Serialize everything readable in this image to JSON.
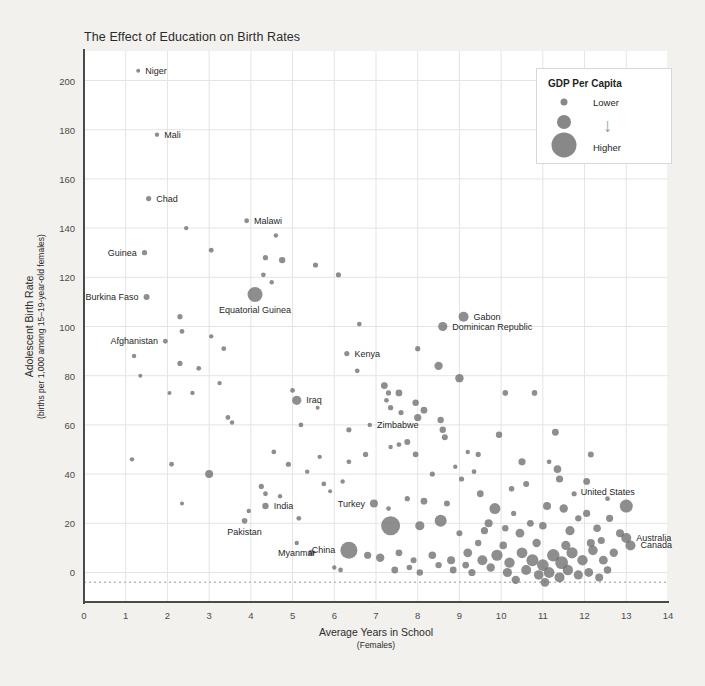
{
  "chart_data": {
    "type": "scatter",
    "title": "The Effect of Education on Birth Rates",
    "xlabel": "Average Years in School",
    "xlabel_sub": "(Females)",
    "ylabel": "Adolescent Birth Rate",
    "ylabel_sub": "(births per 1,000 among 15–19-year-old females)",
    "xlim": [
      0,
      14
    ],
    "ylim": [
      -12,
      212
    ],
    "xticks": [
      0,
      1,
      2,
      3,
      4,
      5,
      6,
      7,
      8,
      9,
      10,
      11,
      12,
      13,
      14
    ],
    "yticks": [
      0,
      20,
      40,
      60,
      80,
      100,
      120,
      140,
      160,
      180,
      200
    ],
    "grid": true,
    "reference_line_y": -4,
    "point_color": "#6e6e6e",
    "size_encodes": "GDP Per Capita",
    "legend": {
      "title": "GDP Per Capita",
      "low_label": "Lower",
      "high_label": "Higher",
      "arrow": "↓",
      "position": "top-right"
    },
    "labeled_points": [
      {
        "name": "Niger",
        "x": 1.3,
        "y": 204,
        "r": 2.0,
        "anchor": "right"
      },
      {
        "name": "Mali",
        "x": 1.75,
        "y": 178,
        "r": 2.2,
        "anchor": "right"
      },
      {
        "name": "Chad",
        "x": 1.55,
        "y": 152,
        "r": 2.6,
        "anchor": "right"
      },
      {
        "name": "Malawi",
        "x": 3.9,
        "y": 143,
        "r": 2.4,
        "anchor": "right"
      },
      {
        "name": "Guinea",
        "x": 1.45,
        "y": 130,
        "r": 2.6,
        "anchor": "left"
      },
      {
        "name": "Burkina Faso",
        "x": 1.5,
        "y": 112,
        "r": 3.0,
        "anchor": "left"
      },
      {
        "name": "Equatorial Guinea",
        "x": 4.1,
        "y": 113,
        "r": 7.5,
        "anchor": "below"
      },
      {
        "name": "Afghanistan",
        "x": 1.95,
        "y": 94,
        "r": 2.4,
        "anchor": "left"
      },
      {
        "name": "Gabon",
        "x": 9.1,
        "y": 104,
        "r": 5.0,
        "anchor": "right"
      },
      {
        "name": "Dominican Republic",
        "x": 8.6,
        "y": 100,
        "r": 4.6,
        "anchor": "right"
      },
      {
        "name": "Kenya",
        "x": 6.3,
        "y": 89,
        "r": 2.6,
        "anchor": "right"
      },
      {
        "name": "Iraq",
        "x": 5.1,
        "y": 70,
        "r": 4.6,
        "anchor": "right"
      },
      {
        "name": "Zimbabwe",
        "x": 6.85,
        "y": 60,
        "r": 2.2,
        "anchor": "right"
      },
      {
        "name": "Turkey",
        "x": 6.95,
        "y": 28,
        "r": 4.0,
        "anchor": "left"
      },
      {
        "name": "India",
        "x": 4.35,
        "y": 27,
        "r": 3.2,
        "anchor": "right"
      },
      {
        "name": "Pakistan",
        "x": 3.85,
        "y": 21,
        "r": 2.8,
        "anchor": "below"
      },
      {
        "name": "Myanmar",
        "x": 5.1,
        "y": 12,
        "r": 2.2,
        "anchor": "below"
      },
      {
        "name": "China",
        "x": 6.35,
        "y": 9,
        "r": 8.5,
        "anchor": "left"
      },
      {
        "name": "United States",
        "x": 13.0,
        "y": 27,
        "r": 6.5,
        "anchor": "above-left"
      },
      {
        "name": "Australia",
        "x": 13.0,
        "y": 14,
        "r": 5.0,
        "anchor": "right"
      },
      {
        "name": "Canada",
        "x": 13.1,
        "y": 11,
        "r": 5.0,
        "anchor": "right"
      }
    ],
    "points": [
      [
        1.3,
        204,
        2.0
      ],
      [
        1.75,
        178,
        2.2
      ],
      [
        1.55,
        152,
        2.6
      ],
      [
        3.9,
        143,
        2.4
      ],
      [
        2.45,
        140,
        2.2
      ],
      [
        1.45,
        130,
        2.6
      ],
      [
        3.05,
        131,
        2.4
      ],
      [
        4.6,
        137,
        2.2
      ],
      [
        4.35,
        128,
        2.6
      ],
      [
        4.75,
        127,
        3.2
      ],
      [
        4.3,
        121,
        2.4
      ],
      [
        5.55,
        125,
        2.6
      ],
      [
        6.1,
        121,
        2.6
      ],
      [
        4.5,
        118,
        2.2
      ],
      [
        1.5,
        112,
        3.0
      ],
      [
        4.1,
        113,
        7.5
      ],
      [
        2.3,
        104,
        2.6
      ],
      [
        2.35,
        98,
        2.4
      ],
      [
        1.95,
        94,
        2.4
      ],
      [
        3.05,
        96,
        2.2
      ],
      [
        9.1,
        104,
        5.0
      ],
      [
        8.6,
        100,
        4.6
      ],
      [
        6.6,
        101,
        2.4
      ],
      [
        6.3,
        89,
        2.6
      ],
      [
        3.35,
        91,
        2.4
      ],
      [
        1.2,
        88,
        2.2
      ],
      [
        1.35,
        80,
        2.0
      ],
      [
        2.3,
        85,
        2.6
      ],
      [
        2.75,
        83,
        2.4
      ],
      [
        3.25,
        77,
        2.2
      ],
      [
        2.05,
        73,
        2.0
      ],
      [
        2.6,
        73,
        2.2
      ],
      [
        8.0,
        91,
        2.6
      ],
      [
        8.5,
        84,
        4.2
      ],
      [
        9.0,
        79,
        4.2
      ],
      [
        6.55,
        82,
        2.4
      ],
      [
        7.2,
        76,
        3.4
      ],
      [
        7.3,
        73,
        2.6
      ],
      [
        7.55,
        73,
        3.4
      ],
      [
        7.25,
        70,
        2.4
      ],
      [
        7.35,
        67,
        2.6
      ],
      [
        5.1,
        70,
        4.6
      ],
      [
        5.0,
        74,
        2.4
      ],
      [
        5.6,
        67,
        2.0
      ],
      [
        3.45,
        63,
        2.4
      ],
      [
        3.55,
        61,
        2.2
      ],
      [
        10.1,
        73,
        2.8
      ],
      [
        10.8,
        73,
        2.8
      ],
      [
        7.95,
        69,
        3.2
      ],
      [
        8.15,
        66,
        3.4
      ],
      [
        6.85,
        60,
        2.2
      ],
      [
        7.6,
        65,
        2.6
      ],
      [
        8.0,
        63,
        3.6
      ],
      [
        8.55,
        62,
        3.2
      ],
      [
        8.6,
        58,
        3.2
      ],
      [
        8.65,
        55,
        3.0
      ],
      [
        6.35,
        58,
        2.6
      ],
      [
        5.2,
        60,
        2.4
      ],
      [
        9.95,
        56,
        3.2
      ],
      [
        11.3,
        57,
        3.4
      ],
      [
        7.75,
        53,
        3.0
      ],
      [
        7.55,
        52,
        2.4
      ],
      [
        7.35,
        51,
        2.2
      ],
      [
        7.95,
        48,
        2.8
      ],
      [
        6.75,
        48,
        2.6
      ],
      [
        6.35,
        45,
        2.4
      ],
      [
        9.2,
        49,
        2.2
      ],
      [
        9.45,
        48,
        2.6
      ],
      [
        12.15,
        48,
        3.0
      ],
      [
        1.15,
        46,
        2.2
      ],
      [
        2.1,
        44,
        2.4
      ],
      [
        3.0,
        40,
        4.0
      ],
      [
        4.9,
        44,
        2.6
      ],
      [
        5.35,
        41,
        2.2
      ],
      [
        10.5,
        45,
        3.6
      ],
      [
        11.15,
        45,
        2.4
      ],
      [
        11.35,
        42,
        3.8
      ],
      [
        11.4,
        38,
        3.6
      ],
      [
        10.6,
        36,
        3.0
      ],
      [
        12.05,
        37,
        3.4
      ],
      [
        4.25,
        35,
        2.6
      ],
      [
        4.35,
        32,
        2.4
      ],
      [
        4.7,
        31,
        2.2
      ],
      [
        6.95,
        28,
        4.0
      ],
      [
        7.3,
        26,
        2.4
      ],
      [
        7.75,
        30,
        2.6
      ],
      [
        8.15,
        29,
        3.4
      ],
      [
        8.7,
        28,
        3.0
      ],
      [
        9.5,
        32,
        3.4
      ],
      [
        9.85,
        26,
        5.5
      ],
      [
        10.3,
        24,
        2.6
      ],
      [
        11.1,
        27,
        4.0
      ],
      [
        11.5,
        26,
        4.2
      ],
      [
        12.05,
        24,
        3.6
      ],
      [
        12.6,
        22,
        3.6
      ],
      [
        13.0,
        27,
        6.5
      ],
      [
        2.35,
        28,
        2.0
      ],
      [
        4.35,
        27,
        3.2
      ],
      [
        3.85,
        21,
        2.8
      ],
      [
        3.95,
        25,
        2.2
      ],
      [
        5.15,
        22,
        2.4
      ],
      [
        8.55,
        21,
        6.0
      ],
      [
        8.05,
        19,
        4.6
      ],
      [
        7.35,
        19,
        9.5
      ],
      [
        9.0,
        16,
        3.0
      ],
      [
        9.6,
        17,
        3.6
      ],
      [
        10.1,
        18,
        3.2
      ],
      [
        10.45,
        16,
        4.4
      ],
      [
        11.0,
        19,
        3.8
      ],
      [
        11.65,
        17,
        4.6
      ],
      [
        12.3,
        18,
        3.8
      ],
      [
        12.85,
        16,
        4.0
      ],
      [
        13.0,
        14,
        5.0
      ],
      [
        13.1,
        11,
        5.0
      ],
      [
        5.1,
        12,
        2.2
      ],
      [
        5.45,
        8,
        3.0
      ],
      [
        6.35,
        9,
        8.5
      ],
      [
        6.8,
        7,
        3.6
      ],
      [
        7.1,
        6,
        4.2
      ],
      [
        7.55,
        8,
        3.4
      ],
      [
        7.9,
        5,
        3.0
      ],
      [
        8.35,
        7,
        3.8
      ],
      [
        8.8,
        5,
        4.0
      ],
      [
        9.2,
        8,
        4.4
      ],
      [
        9.55,
        5,
        5.0
      ],
      [
        9.9,
        7,
        5.6
      ],
      [
        10.2,
        4,
        5.2
      ],
      [
        10.5,
        8,
        5.4
      ],
      [
        10.75,
        5,
        6.0
      ],
      [
        11.0,
        3,
        5.8
      ],
      [
        11.25,
        7,
        6.2
      ],
      [
        11.45,
        4,
        6.4
      ],
      [
        11.7,
        8,
        5.6
      ],
      [
        11.95,
        5,
        5.2
      ],
      [
        12.2,
        9,
        4.8
      ],
      [
        12.45,
        5,
        4.4
      ],
      [
        12.7,
        8,
        4.2
      ],
      [
        6.0,
        2,
        2.2
      ],
      [
        6.15,
        1,
        2.4
      ],
      [
        7.45,
        1,
        3.4
      ],
      [
        8.05,
        0,
        3.2
      ],
      [
        8.85,
        1,
        3.4
      ],
      [
        9.3,
        0,
        3.6
      ],
      [
        9.75,
        2,
        4.2
      ],
      [
        10.15,
        0,
        4.6
      ],
      [
        10.6,
        1,
        5.0
      ],
      [
        10.9,
        -1,
        4.8
      ],
      [
        11.15,
        0,
        5.4
      ],
      [
        11.4,
        -2,
        5.0
      ],
      [
        11.6,
        1,
        5.2
      ],
      [
        11.85,
        -1,
        4.6
      ],
      [
        12.1,
        0,
        4.4
      ],
      [
        12.35,
        -2,
        4.0
      ],
      [
        12.55,
        1,
        3.8
      ],
      [
        10.35,
        -3,
        4.2
      ],
      [
        11.05,
        -4,
        4.4
      ],
      [
        9.45,
        12,
        3.2
      ],
      [
        10.05,
        11,
        3.8
      ],
      [
        10.85,
        12,
        4.2
      ],
      [
        11.55,
        11,
        4.6
      ],
      [
        12.15,
        12,
        4.0
      ],
      [
        9.15,
        3,
        3.4
      ],
      [
        8.5,
        3,
        3.2
      ],
      [
        7.8,
        2,
        2.8
      ],
      [
        10.7,
        20,
        3.4
      ],
      [
        11.85,
        22,
        3.2
      ],
      [
        12.4,
        13,
        3.6
      ],
      [
        9.7,
        20,
        4.0
      ],
      [
        10.25,
        34,
        2.8
      ],
      [
        11.75,
        32,
        2.6
      ],
      [
        12.55,
        30,
        2.4
      ],
      [
        9.05,
        38,
        2.6
      ],
      [
        9.35,
        41,
        2.4
      ],
      [
        8.9,
        43,
        2.2
      ],
      [
        8.35,
        40,
        2.6
      ],
      [
        6.2,
        37,
        2.2
      ],
      [
        5.75,
        36,
        2.4
      ],
      [
        5.9,
        33,
        2.0
      ],
      [
        4.55,
        49,
        2.4
      ],
      [
        5.65,
        47,
        2.2
      ]
    ]
  }
}
